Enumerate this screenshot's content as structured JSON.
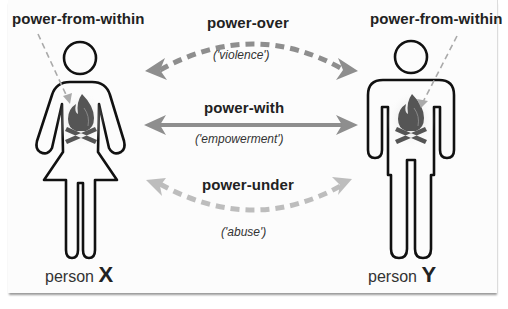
{
  "diagram": {
    "persons": [
      {
        "name_prefix": "person",
        "letter": "X",
        "figure": "woman",
        "inner_label": "power-from-within"
      },
      {
        "name_prefix": "person",
        "letter": "Y",
        "figure": "man",
        "inner_label": "power-from-within"
      }
    ],
    "relations": [
      {
        "label": "power-over",
        "subtitle": "('violence')",
        "style": "dashed-arc-up"
      },
      {
        "label": "power-with",
        "subtitle": "('empowerment')",
        "style": "solid-straight"
      },
      {
        "label": "power-under",
        "subtitle": "('abuse')",
        "style": "dashed-arc-down-light"
      }
    ],
    "icons": [
      "fire-icon",
      "fire-icon"
    ],
    "colors": {
      "arrow_dark": "#8a8a8a",
      "arrow_light": "#bdbdbd",
      "outline": "#111111",
      "fire": "#555555"
    }
  }
}
